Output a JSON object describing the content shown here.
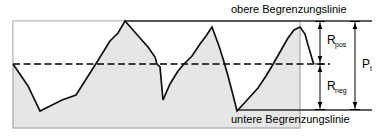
{
  "diagram": {
    "labels": {
      "upper_limit": "obere Begrenzungslinie",
      "lower_limit": "untere Begrenzungslinie",
      "r_pos_base": "R",
      "r_pos_sub": "pos",
      "r_neg_base": "R",
      "r_neg_sub": "neg",
      "pt_base": "P",
      "pt_sub": "t"
    },
    "colors": {
      "fill": "#e0e0e0",
      "stroke": "#1a1a1a",
      "background": "#ffffff",
      "boxOutline": "#9a9a9a"
    },
    "geometry": {
      "upper_limit_y": 21,
      "lower_limit_y": 110,
      "mean_line_y": 64,
      "box_left": 13,
      "box_right": 300,
      "box_bottom": 128,
      "dim_line_1_x": 320,
      "dim_line_2_x": 355,
      "upper_limit_line_x1": 125,
      "upper_limit_line_x2": 372,
      "lower_limit_line_x1": 237,
      "lower_limit_line_x2": 372,
      "mean_line_x1": 13,
      "mean_line_x2": 330
    },
    "profile_points": "13,64 28,86 40,111 62,100 76,95 97,62 110,41 118,33 125,21 140,38 148,47 155,57 157,64 160,67 163,100 170,84 178,71 184,64 192,56 200,44 206,36 212,27 219,46 224,62 228,76 233,95 237,111 248,99 258,88 266,76 272,66 280,52 288,38 294,30 300,27 305,34 308,45 311,55 313,62 314,64"
  }
}
